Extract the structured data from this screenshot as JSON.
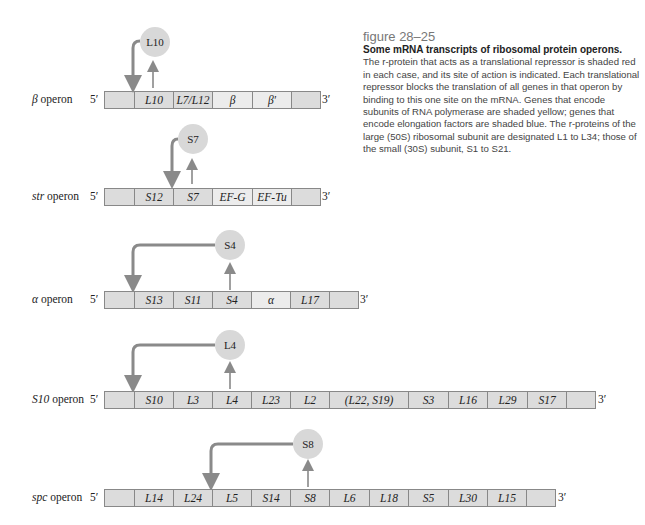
{
  "caption": {
    "figure_label": "figure 28–25",
    "title": "Some mRNA transcripts of ribosomal protein operons.",
    "body": "The r-protein that acts as a translational repressor is shaded red in each case, and its site of action is indicated. Each translational repressor blocks the translation of all genes in that operon by binding to this one site on the mRNA. Genes that encode subunits of RNA polymerase are shaded yellow; genes that encode elongation factors are shaded blue. The r-proteins of the large (50S) ribosomal subunit are designated L1 to L34; those of the small (30S) subunit, S1 to S21."
  },
  "labels": {
    "five_prime": "5′",
    "three_prime": "3′"
  },
  "operons": [
    {
      "name_italic": "β",
      "name_rest": " operon",
      "repressor": "L10",
      "genes": [
        "",
        "L10",
        "L7/L12",
        "β",
        "β′",
        ""
      ]
    },
    {
      "name_italic": "str",
      "name_rest": " operon",
      "repressor": "S7",
      "genes": [
        "",
        "S12",
        "S7",
        "EF-G",
        "EF-Tu",
        ""
      ]
    },
    {
      "name_italic": "α",
      "name_rest": " operon",
      "repressor": "S4",
      "genes": [
        "",
        "S13",
        "S11",
        "S4",
        "α",
        "L17",
        ""
      ]
    },
    {
      "name_italic": "S10",
      "name_rest": " operon",
      "repressor": "L4",
      "genes": [
        "",
        "S10",
        "L3",
        "L4",
        "L23",
        "L2",
        "(L22, S19)",
        "S3",
        "L16",
        "L29",
        "S17",
        ""
      ]
    },
    {
      "name_italic": "spc",
      "name_rest": " operon",
      "repressor": "S8",
      "genes": [
        "",
        "L14",
        "L24",
        "L5",
        "S14",
        "S8",
        "L6",
        "L18",
        "S5",
        "L30",
        "L15",
        ""
      ]
    }
  ]
}
